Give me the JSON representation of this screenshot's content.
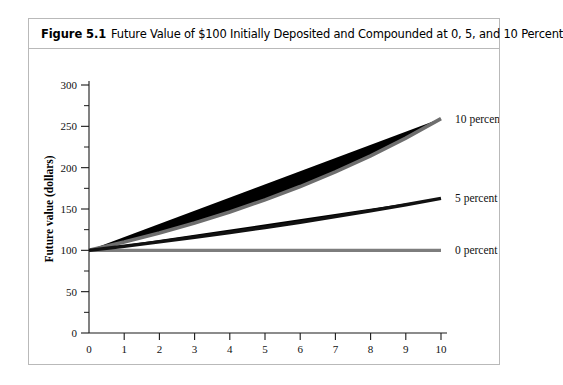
{
  "figure": {
    "number": "Figure 5.1",
    "title": "Future Value of $100 Initially Deposited and Compounded at 0, 5, and 10 Percent"
  },
  "chart_data": {
    "type": "line",
    "title": "Future Value of $100 Initially Deposited and Compounded at 0, 5, and 10 Percent",
    "xlabel": "Year",
    "ylabel": "Future value (dollars)",
    "xlim": [
      0,
      10
    ],
    "ylim": [
      0,
      300
    ],
    "grid": false,
    "legend_position": "inline-right",
    "x_ticks": [
      "0",
      "1",
      "2",
      "3",
      "4",
      "5",
      "6",
      "7",
      "8",
      "9",
      "10"
    ],
    "x_tick_values": [
      0,
      1,
      2,
      3,
      4,
      5,
      6,
      7,
      8,
      9,
      10
    ],
    "y_ticks": [
      "0",
      "50",
      "100",
      "150",
      "200",
      "250",
      "300"
    ],
    "y_tick_values": [
      0,
      50,
      100,
      150,
      200,
      250,
      300
    ],
    "y_minor_tick_values": [
      25,
      75,
      125,
      175,
      225,
      275
    ],
    "x": [
      0,
      1,
      2,
      3,
      4,
      5,
      6,
      7,
      8,
      9,
      10
    ],
    "series": [
      {
        "name": "10 percent",
        "label": "10 percent",
        "color": "#6e6e6e",
        "width": 3.6,
        "values": [
          100,
          110,
          121,
          133.1,
          146.41,
          161.05,
          177.16,
          194.87,
          214.36,
          235.79,
          259.37
        ]
      },
      {
        "name": "5 percent",
        "label": "5 percent",
        "color": "#111111",
        "width": 3.4,
        "values": [
          100,
          105,
          110.25,
          115.76,
          121.55,
          127.63,
          134.01,
          140.71,
          147.75,
          155.13,
          162.89
        ]
      },
      {
        "name": "0 percent",
        "label": "0 percent",
        "color": "#7d7d7d",
        "width": 3.2,
        "values": [
          100,
          100,
          100,
          100,
          100,
          100,
          100,
          100,
          100,
          100,
          100
        ]
      }
    ]
  },
  "colors": {
    "border": "#b9b9b9",
    "axis": "#1a1a1a",
    "background": "#ffffff"
  }
}
